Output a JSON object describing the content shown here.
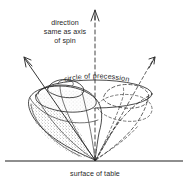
{
  "figure": {
    "background_color": "#ffffff",
    "ink_color": "#2b2b2b",
    "labels": {
      "direction_line1": "direction",
      "direction_line2": "same as axis",
      "direction_line3": "of spin",
      "circle_of_precession": "circle of precession",
      "surface_of_table": "surface of table"
    },
    "elements": {
      "spin_axis_arrow": "solid arrow pointing up and to the left",
      "precession_axis_arrow": "vertical dashed arrow pointing up",
      "ghost_axis_arrow": "dashed arrow pointing up and to the right",
      "top_body_solid": "shaded acorn-shaped spinning top",
      "top_body_ghost": "dashed outline of precessed top",
      "precession_ellipse": "ellipse traced by the tip of the spin axis",
      "pivot_point": "contact point of the top on the table",
      "table_surface": "horizontal line representing the table"
    },
    "geometry": {
      "pivot_x": 95,
      "pivot_y": 160,
      "table_line_y": 161,
      "table_line_x_start": 5,
      "table_line_x_end": 183,
      "spin_arrow_tip_x": 24,
      "spin_arrow_tip_y": 58,
      "vertical_arrow_tip_x": 95,
      "vertical_arrow_tip_y": 10,
      "ghost_arrow_tip_x": 155,
      "ghost_arrow_tip_y": 57,
      "ellipse_center_x": 95,
      "ellipse_center_y": 93,
      "ellipse_rx": 58,
      "ellipse_ry": 14
    }
  }
}
